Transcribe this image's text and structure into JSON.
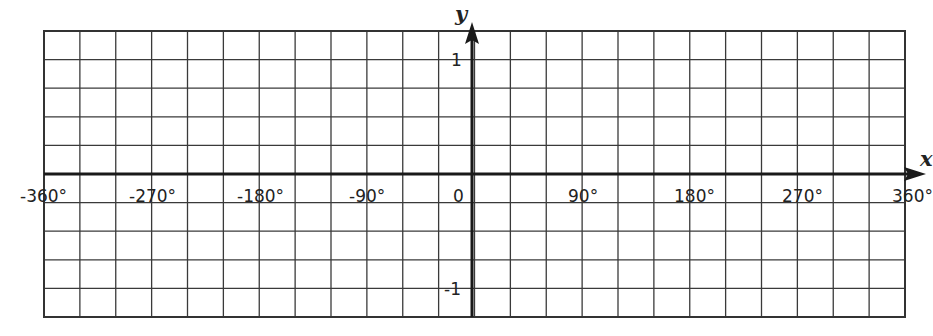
{
  "chart_data": {
    "type": "line",
    "title": "",
    "xlabel": "x",
    "ylabel": "y",
    "xlim": [
      -360,
      360
    ],
    "ylim": [
      -1.25,
      1.25
    ],
    "grid": true,
    "grid_columns": 24,
    "grid_rows": 10,
    "x_grid_step_deg": 30,
    "y_grid_step": 0.25,
    "x_tick_labels": [
      "-360°",
      "-270°",
      "-180°",
      "-90°",
      "0",
      "90°",
      "180°",
      "270°",
      "360°"
    ],
    "x_tick_values": [
      -360,
      -270,
      -180,
      -90,
      0,
      90,
      180,
      270,
      360
    ],
    "y_tick_labels": [
      "1",
      "-1"
    ],
    "y_tick_values": [
      1,
      -1
    ],
    "series": []
  },
  "labels": {
    "x_axis": "x",
    "y_axis": "y",
    "ticks_x": [
      "-360°",
      "-270°",
      "-180°",
      "-90°",
      "0",
      "90°",
      "180°",
      "270°",
      "360°"
    ],
    "tick_y_pos": "1",
    "tick_y_neg": "-1"
  },
  "colors": {
    "grid": "#3a3a3a",
    "axis": "#1a1a1a",
    "background": "#ffffff"
  }
}
